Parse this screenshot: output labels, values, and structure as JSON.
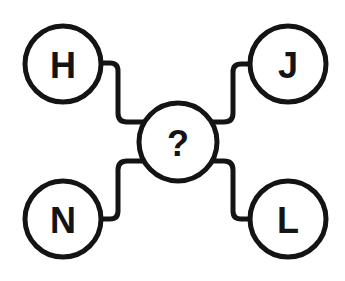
{
  "puzzle": {
    "center": {
      "label": "?"
    },
    "nodes": [
      {
        "position": "top-left",
        "label": "H"
      },
      {
        "position": "top-right",
        "label": "J"
      },
      {
        "position": "bottom-left",
        "label": "N"
      },
      {
        "position": "bottom-right",
        "label": "L"
      }
    ]
  },
  "colors": {
    "stroke": "#141414",
    "background": "#ffffff"
  }
}
